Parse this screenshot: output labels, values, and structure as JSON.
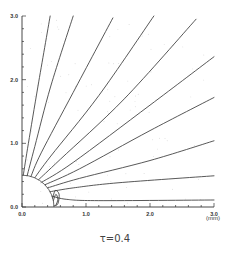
{
  "chart_data": {
    "type": "line",
    "title": "",
    "caption": "τ=0.4",
    "xlabel": "(mm)",
    "ylabel": "",
    "xlim": [
      0,
      3
    ],
    "ylim": [
      0,
      3
    ],
    "grid": false,
    "x_ticks": [
      0.0,
      1.0,
      2.0,
      3.0
    ],
    "x_tick_labels": [
      "0.0",
      "1.0",
      "2.0",
      "3.0"
    ],
    "y_ticks": [
      0.0,
      1.0,
      2.0,
      3.0
    ],
    "y_tick_labels": [
      "0.0",
      "1.0",
      "2.0",
      "3.0"
    ],
    "minor_tick_step": 0.2,
    "obstacle": {
      "shape": "quarter-circle",
      "center": [
        0,
        0
      ],
      "radius": 0.5
    },
    "series": [
      {
        "name": "streamline-1",
        "points": [
          [
            0.02,
            0.5
          ],
          [
            0.1,
            1.0
          ],
          [
            0.25,
            1.9
          ],
          [
            0.44,
            3.0
          ]
        ]
      },
      {
        "name": "streamline-2",
        "points": [
          [
            0.08,
            0.49
          ],
          [
            0.2,
            0.95
          ],
          [
            0.45,
            1.9
          ],
          [
            0.8,
            3.0
          ]
        ]
      },
      {
        "name": "streamline-3",
        "points": [
          [
            0.14,
            0.48
          ],
          [
            0.3,
            0.85
          ],
          [
            0.8,
            1.8
          ],
          [
            1.42,
            2.97
          ]
        ]
      },
      {
        "name": "streamline-4",
        "points": [
          [
            0.2,
            0.46
          ],
          [
            0.45,
            0.8
          ],
          [
            1.2,
            1.75
          ],
          [
            2.06,
            3.0
          ]
        ]
      },
      {
        "name": "streamline-5",
        "points": [
          [
            0.26,
            0.43
          ],
          [
            0.6,
            0.75
          ],
          [
            1.6,
            1.7
          ],
          [
            2.72,
            2.95
          ]
        ]
      },
      {
        "name": "streamline-6",
        "points": [
          [
            0.31,
            0.39
          ],
          [
            0.8,
            0.7
          ],
          [
            2.0,
            1.6
          ],
          [
            3.0,
            2.36
          ]
        ]
      },
      {
        "name": "streamline-7",
        "points": [
          [
            0.36,
            0.35
          ],
          [
            0.9,
            0.6
          ],
          [
            2.0,
            1.2
          ],
          [
            3.0,
            1.72
          ]
        ]
      },
      {
        "name": "streamline-8",
        "points": [
          [
            0.4,
            0.3
          ],
          [
            0.9,
            0.45
          ],
          [
            2.0,
            0.73
          ],
          [
            3.0,
            1.04
          ]
        ]
      },
      {
        "name": "streamline-9",
        "points": [
          [
            0.44,
            0.24
          ],
          [
            0.8,
            0.3
          ],
          [
            1.5,
            0.38
          ],
          [
            3.0,
            0.49
          ]
        ]
      },
      {
        "name": "streamline-10",
        "points": [
          [
            0.47,
            0.17
          ],
          [
            0.7,
            0.12
          ],
          [
            1.2,
            0.1
          ],
          [
            3.0,
            0.11
          ]
        ]
      },
      {
        "name": "wake-loop-1",
        "points": [
          [
            0.48,
            0.14
          ],
          [
            0.52,
            0.26
          ],
          [
            0.58,
            0.2
          ],
          [
            0.56,
            0.05
          ],
          [
            0.5,
            0.02
          ]
        ]
      },
      {
        "name": "wake-loop-2",
        "points": [
          [
            0.49,
            0.1
          ],
          [
            0.53,
            0.2
          ],
          [
            0.56,
            0.12
          ],
          [
            0.53,
            0.03
          ]
        ]
      }
    ]
  }
}
